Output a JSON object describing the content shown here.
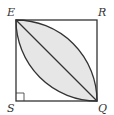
{
  "diagram": {
    "type": "geometry",
    "vertices": {
      "E": "E",
      "R": "R",
      "S": "S",
      "Q": "Q"
    },
    "right_angle_at": "S",
    "colors": {
      "stroke": "#333333",
      "shade": "#e6e6e6",
      "background": "#ffffff"
    }
  }
}
